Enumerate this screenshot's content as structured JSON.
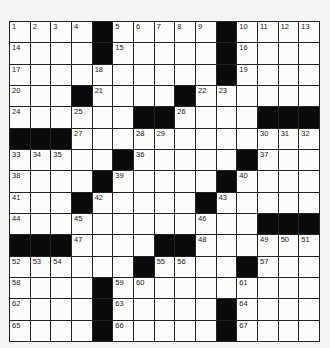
{
  "puzzle": {
    "rows": 15,
    "cols": 15,
    "colors": {
      "black": "#0a0a0a",
      "white": "#fbfbf9",
      "line": "#222222"
    },
    "grid": [
      "....#.....#....",
      "....#.....#....",
      "..........#....",
      "...#....#......",
      "......##....###",
      "###............",
      ".....#.....#...",
      "....#.....#....",
      "...#.....#.....",
      "............###",
      "###....##......",
      "......#....#...",
      "....#..........",
      "....#.....#....",
      "....#.....#...."
    ],
    "numbers": [
      [
        1,
        2,
        3,
        4,
        0,
        5,
        6,
        7,
        8,
        9,
        0,
        10,
        11,
        12,
        13
      ],
      [
        14,
        0,
        0,
        0,
        0,
        15,
        0,
        0,
        0,
        0,
        0,
        16,
        0,
        0,
        0
      ],
      [
        17,
        0,
        0,
        0,
        18,
        0,
        0,
        0,
        0,
        0,
        0,
        19,
        0,
        0,
        0
      ],
      [
        20,
        0,
        0,
        0,
        21,
        0,
        0,
        0,
        0,
        22,
        23,
        0,
        0,
        0,
        0
      ],
      [
        24,
        0,
        0,
        25,
        0,
        0,
        0,
        0,
        26,
        0,
        0,
        0,
        0,
        0,
        0
      ],
      [
        0,
        0,
        0,
        27,
        0,
        0,
        28,
        29,
        0,
        0,
        0,
        0,
        30,
        31,
        32
      ],
      [
        33,
        34,
        35,
        0,
        0,
        0,
        36,
        0,
        0,
        0,
        0,
        0,
        37,
        0,
        0
      ],
      [
        38,
        0,
        0,
        0,
        0,
        39,
        0,
        0,
        0,
        0,
        0,
        40,
        0,
        0,
        0
      ],
      [
        41,
        0,
        0,
        0,
        42,
        0,
        0,
        0,
        0,
        0,
        43,
        0,
        0,
        0,
        0
      ],
      [
        44,
        0,
        0,
        45,
        0,
        0,
        0,
        0,
        0,
        46,
        0,
        0,
        0,
        0,
        0
      ],
      [
        0,
        0,
        0,
        47,
        0,
        0,
        0,
        0,
        0,
        48,
        0,
        0,
        49,
        50,
        51
      ],
      [
        52,
        53,
        54,
        0,
        0,
        0,
        0,
        55,
        56,
        0,
        0,
        0,
        57,
        0,
        0
      ],
      [
        58,
        0,
        0,
        0,
        0,
        59,
        60,
        0,
        0,
        0,
        0,
        61,
        0,
        0,
        0
      ],
      [
        62,
        0,
        0,
        0,
        0,
        63,
        0,
        0,
        0,
        0,
        0,
        64,
        0,
        0,
        0
      ],
      [
        65,
        0,
        0,
        0,
        0,
        66,
        0,
        0,
        0,
        0,
        0,
        67,
        0,
        0,
        0
      ]
    ]
  }
}
